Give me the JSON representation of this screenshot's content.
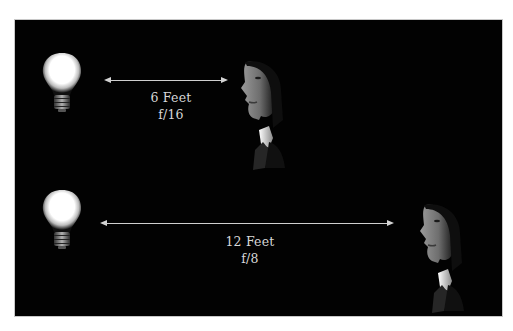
{
  "diagram": {
    "background_color": "#020202",
    "frame_border_color": "#c8c8c8",
    "arrow_color": "#d4d4d4",
    "text_color": "#d8d8d8",
    "top_row": {
      "light_icon": "lightbulb-icon",
      "subject_icon": "face-profile-icon",
      "distance_label": "6 Feet",
      "aperture_label": "f/16"
    },
    "bottom_row": {
      "light_icon": "lightbulb-icon",
      "subject_icon": "face-profile-icon",
      "distance_label": "12 Feet",
      "aperture_label": "f/8"
    }
  }
}
